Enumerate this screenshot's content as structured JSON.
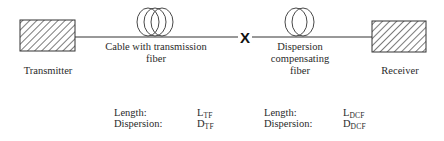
{
  "components": {
    "transmitter": {
      "label": "Transmitter"
    },
    "transmission_cable": {
      "label_line1": "Cable with transmission",
      "label_line2": "fiber"
    },
    "splice": {
      "symbol": "X"
    },
    "dcf": {
      "label_line1": "Dispersion",
      "label_line2": "compensating",
      "label_line3": "fiber"
    },
    "receiver": {
      "label": "Receiver"
    }
  },
  "parameters": {
    "tf": {
      "length_label": "Length:",
      "length_symbol": "L",
      "length_subscript": "TF",
      "dispersion_label": "Dispersion:",
      "dispersion_symbol": "D",
      "dispersion_subscript": "TF"
    },
    "dcf": {
      "length_label": "Length:",
      "length_symbol": "L",
      "length_subscript": "DCF",
      "dispersion_label": "Dispersion:",
      "dispersion_symbol": "D",
      "dispersion_subscript": "DCF"
    }
  },
  "colors": {
    "line": "#333333",
    "text": "#2a2a2a"
  }
}
